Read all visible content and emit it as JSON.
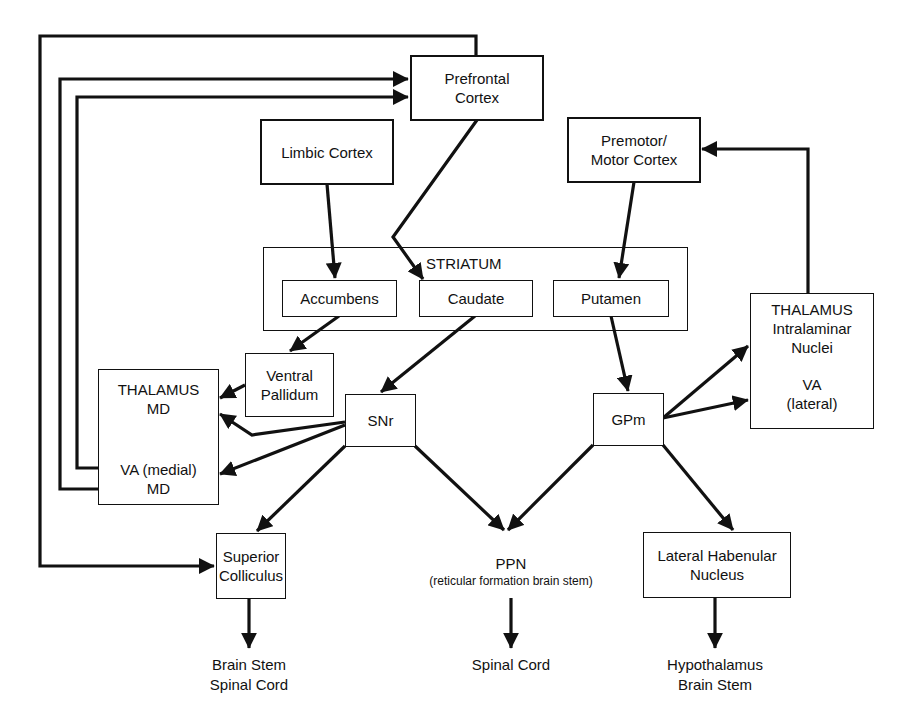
{
  "diagram": {
    "colors": {
      "line": "#111111",
      "background": "#ffffff"
    },
    "nodes": {
      "prefrontal": {
        "lines": [
          "Prefrontal",
          "Cortex"
        ]
      },
      "limbic": {
        "lines": [
          "Limbic Cortex"
        ]
      },
      "premotor": {
        "lines": [
          "Premotor/",
          "Motor Cortex"
        ]
      },
      "striatum": {
        "title": "STRIATUM"
      },
      "accumbens": {
        "lines": [
          "Accumbens"
        ]
      },
      "caudate": {
        "lines": [
          "Caudate"
        ]
      },
      "putamen": {
        "lines": [
          "Putamen"
        ]
      },
      "ventral_pallidum": {
        "lines": [
          "Ventral",
          "Pallidum"
        ]
      },
      "thalamus_md": {
        "top": [
          "THALAMUS",
          "MD"
        ],
        "bottom": [
          "VA (medial)",
          "MD"
        ]
      },
      "snr": {
        "lines": [
          "SNr"
        ]
      },
      "gpm": {
        "lines": [
          "GPm"
        ]
      },
      "thalamus_intralaminar": {
        "top": [
          "THALAMUS",
          "Intralaminar",
          "Nuclei"
        ],
        "bottom": [
          "VA",
          "(lateral)"
        ]
      },
      "superior_colliculus": {
        "lines": [
          "Superior",
          "Colliculus"
        ]
      },
      "ppn": {
        "lines": [
          "PPN"
        ],
        "sub": "(reticular formation brain stem)"
      },
      "lateral_habenular": {
        "lines": [
          "Lateral Habenular",
          "Nucleus"
        ]
      }
    },
    "outputs": {
      "sc_out": [
        "Brain Stem",
        "Spinal Cord"
      ],
      "ppn_out": [
        "Spinal Cord"
      ],
      "lhb_out": [
        "Hypothalamus",
        "Brain Stem"
      ]
    },
    "edges": [
      {
        "from": "Limbic Cortex",
        "to": "Accumbens"
      },
      {
        "from": "Prefrontal Cortex",
        "to": "Caudate"
      },
      {
        "from": "Premotor/Motor Cortex",
        "to": "Putamen"
      },
      {
        "from": "Accumbens",
        "to": "Ventral Pallidum"
      },
      {
        "from": "Caudate",
        "to": "SNr"
      },
      {
        "from": "Putamen",
        "to": "GPm"
      },
      {
        "from": "Ventral Pallidum",
        "to": "THALAMUS MD"
      },
      {
        "from": "SNr",
        "to": "THALAMUS MD"
      },
      {
        "from": "SNr",
        "to": "VA (medial) MD"
      },
      {
        "from": "SNr",
        "to": "Superior Colliculus"
      },
      {
        "from": "SNr",
        "to": "PPN"
      },
      {
        "from": "GPm",
        "to": "PPN"
      },
      {
        "from": "GPm",
        "to": "THALAMUS Intralaminar Nuclei"
      },
      {
        "from": "GPm",
        "to": "VA (lateral)"
      },
      {
        "from": "GPm",
        "to": "Lateral Habenular Nucleus"
      },
      {
        "from": "THALAMUS Intralaminar",
        "to": "Premotor/Motor Cortex"
      },
      {
        "from": "VA (medial) MD",
        "to": "Prefrontal Cortex"
      },
      {
        "from": "THALAMUS MD",
        "to": "Prefrontal Cortex"
      },
      {
        "from": "Prefrontal Cortex",
        "to": "Superior Colliculus"
      },
      {
        "from": "Superior Colliculus",
        "to": "Brain Stem / Spinal Cord"
      },
      {
        "from": "PPN",
        "to": "Spinal Cord"
      },
      {
        "from": "Lateral Habenular Nucleus",
        "to": "Hypothalamus / Brain Stem"
      }
    ]
  }
}
